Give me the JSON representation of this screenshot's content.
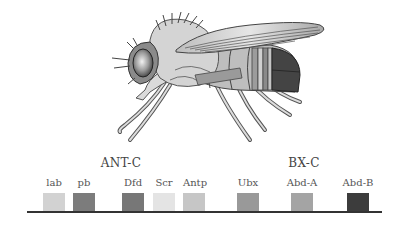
{
  "figure": {
    "complexes": [
      {
        "name": "ANT-C",
        "center_x": 121
      },
      {
        "name": "BX-C",
        "center_x": 304
      }
    ],
    "genes": [
      {
        "label": "lab",
        "complex": "ANT-C",
        "x": 43,
        "color": "#d2d2d2"
      },
      {
        "label": "pb",
        "complex": "ANT-C",
        "x": 73,
        "color": "#7c7c7c"
      },
      {
        "label": "Dfd",
        "complex": "ANT-C",
        "x": 122,
        "color": "#777777"
      },
      {
        "label": "Scr",
        "complex": "ANT-C",
        "x": 153,
        "color": "#e4e4e4"
      },
      {
        "label": "Antp",
        "complex": "ANT-C",
        "x": 183,
        "color": "#c6c6c6"
      },
      {
        "label": "Ubx",
        "complex": "BX-C",
        "x": 237,
        "color": "#999999"
      },
      {
        "label": "Abd-A",
        "complex": "BX-C",
        "x": 291,
        "color": "#a4a4a4"
      },
      {
        "label": "Abd-B",
        "complex": "BX-C",
        "x": 347,
        "color": "#3c3c3c"
      }
    ]
  }
}
